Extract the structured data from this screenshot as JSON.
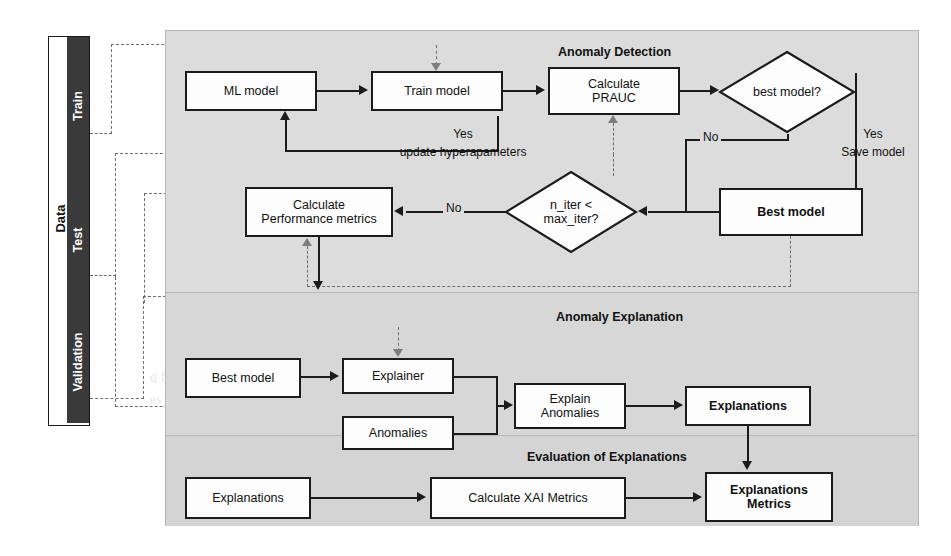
{
  "figure": {
    "kind": "pipeline-flowchart",
    "sidebar": {
      "title": "Data",
      "splits": [
        {
          "name": "Train"
        },
        {
          "name": "Test"
        },
        {
          "name": "Validation"
        }
      ]
    },
    "sections": [
      {
        "id": "anomaly-detection",
        "title": "Anomaly Detection"
      },
      {
        "id": "anomaly-explanation",
        "title": "Anomaly Explanation"
      },
      {
        "id": "evaluation-of-explanations",
        "title": "Evaluation of Explanations"
      }
    ],
    "nodes": {
      "ml_model": "ML model",
      "train_model": "Train model",
      "calculate_prauc": "Calculate\nPRAUC",
      "calculate_prauc_l1": "Calculate",
      "calculate_prauc_l2": "PRAUC",
      "best_model_decision": "best model?",
      "best_model_box": "Best model",
      "calc_perf_l1": "Calculate",
      "calc_perf_l2": "Performance metrics",
      "n_iter_decision_l1": "n_iter <",
      "n_iter_decision_l2": "max_iter?",
      "best_model_explain": "Best model",
      "explainer": "Explainer",
      "anomalies": "Anomalies",
      "explain_anomalies_l1": "Explain",
      "explain_anomalies_l2": "Anomalies",
      "explanations": "Explanations",
      "explanations_input": "Explanations",
      "calculate_xai_metrics": "Calculate XAI Metrics",
      "explanations_metrics_l1": "Explanations",
      "explanations_metrics_l2": "Metrics"
    },
    "edge_labels": {
      "yes_update_l1": "Yes",
      "yes_update_l2": "update hyperapameters",
      "yes_save_l1": "Yes",
      "yes_save_l2": "Save model",
      "no_from_best_model": "No",
      "no_from_n_iter": "No"
    },
    "colors": {
      "panel_background": "#d9d9d9",
      "node_fill": "#fdfdfd",
      "stroke": "#1b1b1b",
      "dashed_stroke": "#6e6e6e",
      "split_bar": "#3a3a3a",
      "split_bar_text": "#ffffff"
    }
  },
  "background_text": {
    "lines": [
      "a  a a t       l",
      "concrete   a    an   el e  n   a  ale   to",
      "d  ed  an",
      "3   Evaluation of Explanations",
      "d  fferent   a      n  m  an       rib tion   XAI m",
      "es of    e       of the explain   ion  meth   s for the  ap",
      "pound"
    ]
  }
}
